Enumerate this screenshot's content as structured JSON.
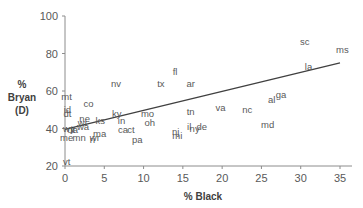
{
  "chart_data": {
    "type": "scatter",
    "title": "",
    "xlabel": "% Black",
    "ylabel_lines": [
      "%",
      "Bryan",
      "(D)"
    ],
    "xlim": [
      0,
      35
    ],
    "ylim": [
      20,
      100
    ],
    "xticks": [
      0,
      5,
      10,
      15,
      20,
      25,
      30,
      35
    ],
    "yticks": [
      20,
      40,
      60,
      80,
      100
    ],
    "grid": false,
    "legend": null,
    "trendline": {
      "type": "linear",
      "x0": 0,
      "y0": 39.5,
      "x1": 35,
      "y1": 75
    },
    "points": [
      {
        "label": "vt",
        "x": 0.2,
        "y": 22
      },
      {
        "label": "mt",
        "x": 0.2,
        "y": 57
      },
      {
        "label": "id",
        "x": 0.3,
        "y": 50
      },
      {
        "label": "dt",
        "x": 0.3,
        "y": 48
      },
      {
        "label": "wy",
        "x": 0.5,
        "y": 40
      },
      {
        "label": "me",
        "x": 0.2,
        "y": 35
      },
      {
        "label": "ut",
        "x": 0.8,
        "y": 39
      },
      {
        "label": "ia",
        "x": 1.2,
        "y": 39
      },
      {
        "label": "mn",
        "x": 1.8,
        "y": 35
      },
      {
        "label": "co",
        "x": 3,
        "y": 53
      },
      {
        "label": "ne",
        "x": 2.5,
        "y": 45
      },
      {
        "label": "wa",
        "x": 2.3,
        "y": 41
      },
      {
        "label": "wi",
        "x": 2.2,
        "y": 43
      },
      {
        "label": "ri",
        "x": 3.5,
        "y": 34
      },
      {
        "label": "wr",
        "x": 3.8,
        "y": 35
      },
      {
        "label": "ma",
        "x": 4.4,
        "y": 37
      },
      {
        "label": "ks",
        "x": 4.5,
        "y": 44
      },
      {
        "label": "ky",
        "x": 6.6,
        "y": 48
      },
      {
        "label": "in",
        "x": 7.2,
        "y": 44
      },
      {
        "label": "nv",
        "x": 6.5,
        "y": 64
      },
      {
        "label": "ca",
        "x": 7.4,
        "y": 39
      },
      {
        "label": "ct",
        "x": 8.4,
        "y": 39
      },
      {
        "label": "pa",
        "x": 9.2,
        "y": 34
      },
      {
        "label": "mo",
        "x": 10.5,
        "y": 48
      },
      {
        "label": "oh",
        "x": 10.8,
        "y": 43
      },
      {
        "label": "tx",
        "x": 12.2,
        "y": 64
      },
      {
        "label": "fl",
        "x": 14,
        "y": 70
      },
      {
        "label": "nj",
        "x": 14.1,
        "y": 38
      },
      {
        "label": "mi",
        "x": 14.3,
        "y": 36
      },
      {
        "label": "il",
        "x": 15.8,
        "y": 41
      },
      {
        "label": "ny",
        "x": 16.5,
        "y": 40
      },
      {
        "label": "de",
        "x": 17.4,
        "y": 41
      },
      {
        "label": "ar",
        "x": 16,
        "y": 64
      },
      {
        "label": "tn",
        "x": 16,
        "y": 49
      },
      {
        "label": "va",
        "x": 19.8,
        "y": 51
      },
      {
        "label": "nc",
        "x": 23.2,
        "y": 50
      },
      {
        "label": "al",
        "x": 26.3,
        "y": 55
      },
      {
        "label": "ga",
        "x": 27.5,
        "y": 58
      },
      {
        "label": "md",
        "x": 25.8,
        "y": 42
      },
      {
        "label": "la",
        "x": 31,
        "y": 73
      },
      {
        "label": "sc",
        "x": 30.5,
        "y": 86
      },
      {
        "label": "ms",
        "x": 35.3,
        "y": 82
      }
    ]
  }
}
